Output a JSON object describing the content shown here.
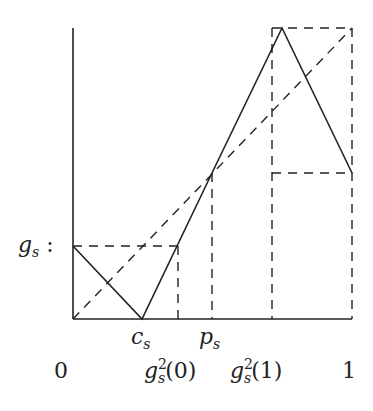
{
  "diagram": {
    "type": "piecewise-linear map plot",
    "axes": {
      "x_ticks": [
        "0",
        "g_s^2(0)",
        "g_s^2(1)",
        "1"
      ]
    },
    "labels": {
      "y_label": {
        "base": "g",
        "sub": "s",
        "suffix": " :"
      },
      "c_s": {
        "base": "c",
        "sub": "s"
      },
      "p_s": {
        "base": "p",
        "sub": "s"
      },
      "x0": "0",
      "x1": "1",
      "g2_0": {
        "base": "g",
        "sup": "2",
        "sub": "s",
        "arg": "(0)"
      },
      "g2_1": {
        "base": "g",
        "sup": "2",
        "sub": "s",
        "arg": "(1)"
      }
    },
    "line_color": "#222222"
  }
}
